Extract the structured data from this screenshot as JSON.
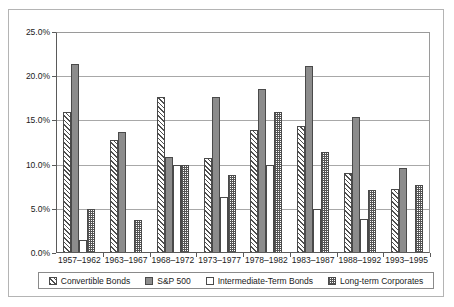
{
  "chart_data": {
    "type": "bar",
    "title": "",
    "xlabel": "",
    "ylabel": "",
    "ylim": [
      0,
      25
    ],
    "ytick_labels": [
      "0.0%",
      "5.0%",
      "10.0%",
      "15.0%",
      "20.0%",
      "25.0%"
    ],
    "ytick_values": [
      0,
      5,
      10,
      15,
      20,
      25
    ],
    "grid": true,
    "legend_position": "bottom",
    "categories": [
      "1957–1962",
      "1963–1967",
      "1968–1972",
      "1973–1977",
      "1978–1982",
      "1983–1987",
      "1988–1992",
      "1993–1995"
    ],
    "series": [
      {
        "name": "Convertible Bonds",
        "pattern": "diagonal-hatch",
        "values": [
          16.0,
          12.8,
          17.6,
          10.8,
          13.9,
          14.4,
          9.0,
          7.2
        ]
      },
      {
        "name": "S&P 500",
        "pattern": "solid-gray",
        "values": [
          21.4,
          13.7,
          10.9,
          17.6,
          18.6,
          21.2,
          15.4,
          9.6
        ]
      },
      {
        "name": "Intermediate-Term Bonds",
        "pattern": "white",
        "values": [
          1.5,
          0.0,
          10.0,
          6.3,
          10.0,
          5.0,
          3.9,
          0.0
        ]
      },
      {
        "name": "Long-term Corporates",
        "pattern": "checkerboard",
        "values": [
          5.0,
          3.7,
          10.0,
          8.8,
          15.9,
          11.4,
          7.1,
          7.7
        ]
      }
    ]
  },
  "colors": {
    "series_solid": "#8c8c8c",
    "axis": "#5a5a5a",
    "gridline": "#a8a8a8",
    "border": "#b4b4b4",
    "text": "#1a1a1a"
  }
}
